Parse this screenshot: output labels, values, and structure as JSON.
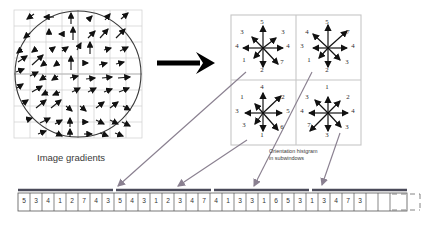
{
  "figure": {
    "left_panel": {
      "label": "Image gradients",
      "grid_cells": 8,
      "circle": "gaussian-weighting-window"
    },
    "right_panel": {
      "label_line1": "Orientation histgram",
      "label_line2": "in subwindows",
      "subwindows": [
        {
          "name": "top-left",
          "bins": [
            {
              "dir": "up",
              "value": "5"
            },
            {
              "dir": "up-right",
              "value": "3"
            },
            {
              "dir": "right",
              "value": "4"
            },
            {
              "dir": "down-right",
              "value": "7"
            },
            {
              "dir": "down",
              "value": "2"
            },
            {
              "dir": "down-left",
              "value": "1"
            },
            {
              "dir": "left",
              "value": "4"
            },
            {
              "dir": "up-left",
              "value": "3"
            }
          ]
        },
        {
          "name": "top-right",
          "bins": [
            {
              "dir": "up",
              "value": "5"
            },
            {
              "dir": "up-right",
              "value": "7"
            },
            {
              "dir": "right",
              "value": "4"
            },
            {
              "dir": "down-right",
              "value": "3"
            },
            {
              "dir": "down",
              "value": "2"
            },
            {
              "dir": "down-left",
              "value": "1"
            },
            {
              "dir": "left",
              "value": "3"
            },
            {
              "dir": "up-left",
              "value": "4"
            }
          ]
        },
        {
          "name": "bottom-left",
          "bins": [
            {
              "dir": "up",
              "value": "4"
            },
            {
              "dir": "up-right",
              "value": "2"
            },
            {
              "dir": "right",
              "value": "5"
            },
            {
              "dir": "down-right",
              "value": "6"
            },
            {
              "dir": "down",
              "value": "1"
            },
            {
              "dir": "down-left",
              "value": "3"
            },
            {
              "dir": "left",
              "value": "3"
            },
            {
              "dir": "up-left",
              "value": "1"
            }
          ]
        },
        {
          "name": "bottom-right",
          "bins": [
            {
              "dir": "up",
              "value": "1"
            },
            {
              "dir": "up-right",
              "value": "2"
            },
            {
              "dir": "right",
              "value": "4"
            },
            {
              "dir": "down-right",
              "value": "3"
            },
            {
              "dir": "down",
              "value": "3"
            },
            {
              "dir": "down-left",
              "value": "7"
            },
            {
              "dir": "left",
              "value": "4"
            },
            {
              "dir": "up-left",
              "value": "3"
            }
          ]
        }
      ]
    },
    "descriptor_vector": {
      "groups": [
        {
          "name": "group-1",
          "values": [
            "5",
            "3",
            "4",
            "1",
            "2",
            "7",
            "4",
            "3"
          ]
        },
        {
          "name": "group-2",
          "values": [
            "5",
            "4",
            "3",
            "1",
            "2",
            "3",
            "4",
            "7"
          ]
        },
        {
          "name": "group-3",
          "values": [
            "4",
            "1",
            "3",
            "3",
            "1",
            "6",
            "5",
            "3"
          ]
        },
        {
          "name": "group-4",
          "values": [
            "1",
            "3",
            "4",
            "7",
            "3"
          ]
        }
      ],
      "truncated": true
    },
    "colors": {
      "arrow_black": "#111111",
      "connector_gray": "#8a8090",
      "grid_gray": "#c9c9c9",
      "strip_bar": "#4b4b5a",
      "text": "#333333"
    }
  }
}
